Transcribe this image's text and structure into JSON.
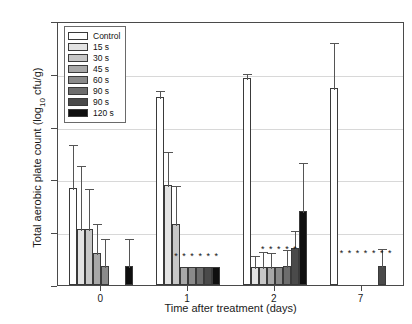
{
  "chart_data": {
    "type": "bar",
    "title": "",
    "xlabel": "Time after treatment (days)",
    "ylabel": "Total aerobic plate count (log10 cfu/g)",
    "ylabel_prefix": "Total aerobic plate count (log",
    "ylabel_sub": "10",
    "ylabel_suffix": " cfu/g)",
    "categories": [
      "0",
      "1",
      "2",
      "7"
    ],
    "ylim": [
      0.0,
      2.5
    ],
    "yticks": [
      "0.0",
      "0.5",
      "1.0",
      "1.5",
      "2.0",
      "2.5"
    ],
    "ytick_values": [
      0.0,
      0.5,
      1.0,
      1.5,
      2.0,
      2.5
    ],
    "grid": true,
    "legend_position": "upper-left",
    "series": [
      {
        "name": "Control",
        "color": "#ffffff",
        "values": [
          0.92,
          1.78,
          1.96,
          1.87
        ],
        "errors": [
          0.42,
          0.08,
          0.06,
          0.44
        ]
      },
      {
        "name": "15 s",
        "color": "#e3e3e3",
        "values": [
          0.53,
          0.95,
          0.17,
          null
        ],
        "errors": [
          0.62,
          0.33,
          0.12,
          null
        ]
      },
      {
        "name": "30 s",
        "color": "#c7c7c7",
        "values": [
          0.53,
          0.58,
          0.17,
          null
        ],
        "errors": [
          0.4,
          0.38,
          0.16,
          null
        ]
      },
      {
        "name": "45 s",
        "color": "#a8a8a8",
        "values": [
          0.3,
          0.17,
          0.17,
          null
        ],
        "errors": [
          0.3,
          0.0,
          0.15,
          null
        ]
      },
      {
        "name": "60 s",
        "color": "#8a8a8a",
        "values": [
          0.18,
          0.17,
          0.17,
          null
        ],
        "errors": [
          0.27,
          0.0,
          0.0,
          null
        ]
      },
      {
        "name": "90 s",
        "color": "#6d6d6d",
        "values": [
          0.0,
          0.17,
          0.18,
          null
        ],
        "errors": [
          0.0,
          0.0,
          0.17,
          null
        ]
      },
      {
        "name": "90 s",
        "color": "#4a4a4a",
        "values": [
          0.0,
          0.17,
          0.35,
          0.18
        ],
        "errors": [
          0.0,
          0.0,
          0.18,
          0.18
        ]
      },
      {
        "name": "120 s",
        "color": "#0f0f0f",
        "values": [
          0.18,
          0.17,
          0.7,
          null
        ],
        "errors": [
          0.27,
          0.0,
          0.47,
          null
        ]
      }
    ],
    "significance_markers": {
      "symbol": "*",
      "groups": [
        {
          "category": "1",
          "count": 6,
          "y": 0.33
        },
        {
          "category": "2",
          "count": 6,
          "y": 0.4
        },
        {
          "category": "7",
          "count": 7,
          "y": 0.36
        }
      ]
    }
  },
  "legend": {
    "items": [
      {
        "label": "Control",
        "color": "#ffffff"
      },
      {
        "label": "15 s",
        "color": "#e3e3e3"
      },
      {
        "label": "30 s",
        "color": "#c7c7c7"
      },
      {
        "label": "45 s",
        "color": "#a8a8a8"
      },
      {
        "label": "60 s",
        "color": "#8a8a8a"
      },
      {
        "label": "90 s",
        "color": "#6d6d6d"
      },
      {
        "label": "90 s",
        "color": "#4a4a4a"
      },
      {
        "label": "120 s",
        "color": "#0f0f0f"
      }
    ]
  }
}
